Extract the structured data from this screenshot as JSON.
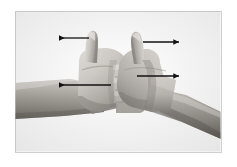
{
  "figure": {
    "kind": "photograph-with-annotations",
    "background_color": "#ffffff",
    "frame": {
      "border_color": "#d0d0d0",
      "fill_color": "#ffffff",
      "x": 15,
      "y": 11,
      "width": 206,
      "height": 141
    },
    "annotations": {
      "arrow_color": "#121212",
      "arrows": [
        {
          "name": "left-thumb-force-arrow",
          "direction": "left",
          "x1": 89,
          "y1": 38,
          "x2": 56,
          "y2": 38
        },
        {
          "name": "right-thumb-force-arrow",
          "direction": "right",
          "x1": 143,
          "y1": 42,
          "x2": 181,
          "y2": 42
        },
        {
          "name": "left-forearm-force-arrow",
          "direction": "left",
          "x1": 111,
          "y1": 85,
          "x2": 56,
          "y2": 85
        },
        {
          "name": "right-forearm-force-arrow",
          "direction": "right",
          "x1": 137,
          "y1": 76,
          "x2": 181,
          "y2": 76
        }
      ]
    },
    "photo_tones": {
      "skin_light": "#d8d4ce",
      "skin_mid": "#b0aca6",
      "skin_shadow": "#8a8680",
      "skin_dark": "#6a6660",
      "skin_darkest": "#3c3a36",
      "highlight": "#eceae6"
    }
  }
}
